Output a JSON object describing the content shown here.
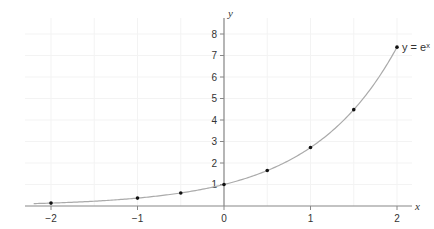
{
  "chart_data": {
    "type": "line",
    "title": "",
    "function_label": "y = eˣ",
    "xlabel": "x",
    "ylabel": "y",
    "xlim": [
      -2.2,
      2.2
    ],
    "ylim": [
      0,
      8.4
    ],
    "x_ticks": [
      -2,
      -1,
      0,
      1,
      2
    ],
    "x_tick_labels": [
      "−2",
      "−1",
      "0",
      "1",
      "2"
    ],
    "y_ticks": [
      1,
      2,
      3,
      4,
      5,
      6,
      7,
      8
    ],
    "y_tick_labels": [
      "1",
      "2",
      "3",
      "4",
      "5",
      "6",
      "7",
      "8"
    ],
    "grid": true,
    "series": [
      {
        "name": "y = e^x",
        "curve": "exp",
        "x_range": [
          -2.2,
          2.0
        ],
        "points": [
          {
            "x": -2,
            "y": 0.135
          },
          {
            "x": -1,
            "y": 0.368
          },
          {
            "x": -0.5,
            "y": 0.607
          },
          {
            "x": 0,
            "y": 1.0
          },
          {
            "x": 0.5,
            "y": 1.649
          },
          {
            "x": 1,
            "y": 2.718
          },
          {
            "x": 1.5,
            "y": 4.482
          },
          {
            "x": 2,
            "y": 7.389
          }
        ]
      }
    ],
    "colors": {
      "axis": "#888888",
      "curve": "#aaaaaa",
      "point": "#111111",
      "grid": "#f3f3f3"
    }
  }
}
